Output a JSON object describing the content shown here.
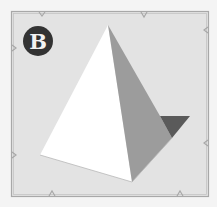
{
  "figure": {
    "label": "B",
    "colors": {
      "page_background": "#f4f4f4",
      "panel_background": "#e3e3e3",
      "frame_stroke": "#a8a8a8",
      "badge_fill": "#333333",
      "badge_text": "#f2f2f2",
      "face_lit": "#ffffff",
      "face_shaded": "#9c9c9c",
      "face_dark": "#5a5a5a"
    },
    "pyramid": {
      "apex": [
        108,
        25
      ],
      "left_base": [
        40,
        155
      ],
      "front_base": [
        132,
        182
      ],
      "right_tip": [
        190,
        116
      ],
      "inner_base": [
        172,
        138
      ]
    }
  }
}
